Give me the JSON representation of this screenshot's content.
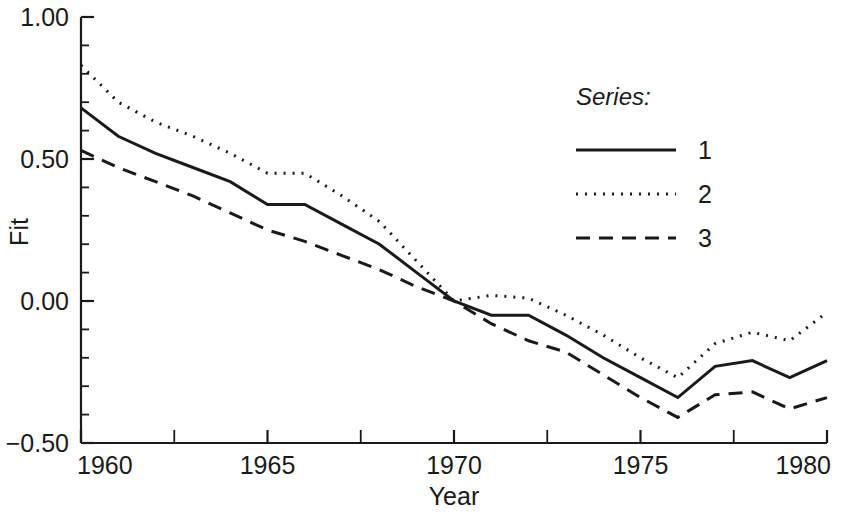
{
  "chart_data": {
    "type": "line",
    "title": "",
    "xlabel": "Year",
    "ylabel": "Fit",
    "xlim": [
      1960,
      1980
    ],
    "ylim": [
      -0.5,
      1.0
    ],
    "grid": false,
    "legend_position": "upper-right-inside",
    "legend_title": "Series:",
    "x_major_ticks": [
      1960,
      1965,
      1970,
      1975,
      1980
    ],
    "x_major_tick_labels": [
      "1960",
      "1965",
      "1970",
      "1975",
      "1980"
    ],
    "x_minor_ticks": [
      1962.5,
      1967.5,
      1972.5,
      1977.5
    ],
    "y_major_ticks": [
      -0.5,
      0.0,
      0.5,
      1.0
    ],
    "y_major_tick_labels": [
      "−0.50",
      "0.00",
      "0.50",
      "1.00"
    ],
    "y_minor_ticks": [
      -0.4,
      -0.3,
      -0.2,
      -0.1,
      0.1,
      0.2,
      0.3,
      0.4,
      0.6,
      0.7,
      0.8,
      0.9
    ],
    "x": [
      1960,
      1961,
      1962,
      1963,
      1964,
      1965,
      1966,
      1967,
      1968,
      1969,
      1970,
      1971,
      1972,
      1973,
      1974,
      1975,
      1976,
      1977,
      1978,
      1979,
      1980
    ],
    "series": [
      {
        "name": "1",
        "label": "1",
        "style": "solid",
        "color": "#1a1a1a",
        "values": [
          0.68,
          0.58,
          0.52,
          0.47,
          0.42,
          0.34,
          0.34,
          0.27,
          0.2,
          0.1,
          0.0,
          -0.05,
          -0.05,
          -0.12,
          -0.2,
          -0.27,
          -0.34,
          -0.23,
          -0.21,
          -0.27,
          -0.21
        ]
      },
      {
        "name": "2",
        "label": "2",
        "style": "dotted",
        "color": "#1a1a1a",
        "values": [
          0.83,
          0.7,
          0.63,
          0.58,
          0.52,
          0.45,
          0.45,
          0.37,
          0.28,
          0.14,
          0.0,
          0.02,
          0.01,
          -0.05,
          -0.12,
          -0.2,
          -0.27,
          -0.15,
          -0.11,
          -0.14,
          -0.04
        ]
      },
      {
        "name": "3",
        "label": "3",
        "style": "dashed",
        "color": "#1a1a1a",
        "values": [
          0.53,
          0.47,
          0.42,
          0.37,
          0.31,
          0.25,
          0.21,
          0.16,
          0.11,
          0.05,
          0.0,
          -0.08,
          -0.14,
          -0.18,
          -0.26,
          -0.34,
          -0.41,
          -0.33,
          -0.32,
          -0.38,
          -0.34
        ]
      }
    ]
  },
  "figure": {
    "background": "#ffffff",
    "foreground": "#1a1a1a"
  }
}
